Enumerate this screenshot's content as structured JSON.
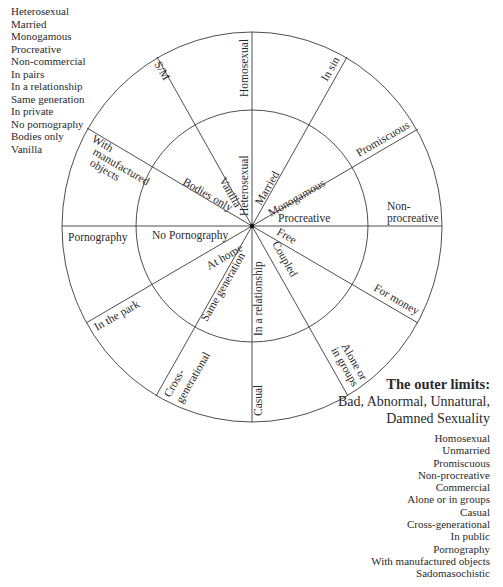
{
  "left_list": {
    "heading": "",
    "items": [
      "Heterosexual",
      "Married",
      "Monogamous",
      "Procreative",
      "Non-commercial",
      "In pairs",
      "In a relationship",
      "Same generation",
      "In private",
      "No pornography",
      "Bodies only",
      "Vanilla"
    ]
  },
  "wheel": {
    "inner_labels": {
      "heterosexual": "Heterosexual",
      "married": "Married",
      "monogamous": "Monogamous",
      "procreative": "Procreative",
      "free": "Free",
      "coupled": "Coupled",
      "in_a_relationship": "In a relationship",
      "same_generation": "Same generation",
      "at_home": "At home",
      "no_pornography": "No Pornography",
      "bodies_only": "Bodies only",
      "vanilla": "Vanilla"
    },
    "outer_labels": {
      "homosexual": "Homosexual",
      "in_sin": "In sin",
      "promiscuous": "Promiscuous",
      "non_procreative_1": "Non-",
      "non_procreative_2": "procreative",
      "for_money": "For money",
      "alone_1": "Alone or",
      "alone_2": "in groups",
      "casual": "Casual",
      "cross_1": "Cross-",
      "cross_2": "generational",
      "in_the_park": "In the park",
      "pornography": "Pornography",
      "objects_1": "With",
      "objects_2": "manufactured",
      "objects_3": "objects",
      "sm": "S/M"
    }
  },
  "outer_limits": {
    "title": "The outer limits:",
    "subtitle_1": "Bad, Abnormal, Unnatural,",
    "subtitle_2": "Damned Sexuality",
    "items": [
      "Homosexual",
      "Unmarried",
      "Promiscuous",
      "Non-procreative",
      "Commercial",
      "Alone or in groups",
      "Casual",
      "Cross-generational",
      "In public",
      "Pornography",
      "With manufactured objects",
      "Sadomasochistic"
    ]
  }
}
